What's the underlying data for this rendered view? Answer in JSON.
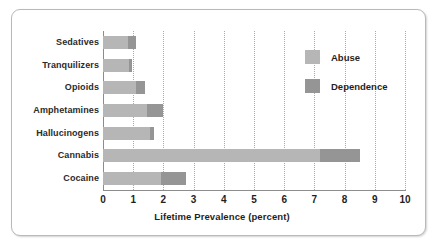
{
  "chart_data": {
    "type": "bar",
    "orientation": "horizontal",
    "stacked": true,
    "title": "",
    "xlabel": "Lifetime Prevalence (percent)",
    "ylabel": "",
    "xlim": [
      0,
      10
    ],
    "xticks": [
      0,
      1,
      2,
      3,
      4,
      5,
      6,
      7,
      8,
      9,
      10
    ],
    "xticklabels": [
      "0",
      "1",
      "2",
      "3",
      "4",
      "5",
      "6",
      "7",
      "8",
      "9",
      "10"
    ],
    "grid": "vertical-dotted",
    "legend_position": "upper-right-inside",
    "categories": [
      "Sedatives",
      "Tranquilizers",
      "Opioids",
      "Amphetamines",
      "Hallucinogens",
      "Cannabis",
      "Cocaine"
    ],
    "series": [
      {
        "name": "Abuse",
        "color": "#b6b6b6",
        "values": [
          0.83,
          0.85,
          1.1,
          1.45,
          1.55,
          7.2,
          1.92
        ]
      },
      {
        "name": "Dependence",
        "color": "#959595",
        "values": [
          0.27,
          0.12,
          0.3,
          0.55,
          0.15,
          1.3,
          0.83
        ]
      }
    ],
    "totals": [
      1.1,
      0.97,
      1.4,
      2.0,
      1.7,
      8.5,
      2.75
    ]
  },
  "legend": {
    "items": [
      {
        "label": "Abuse",
        "swatch": "abuse"
      },
      {
        "label": "Dependence",
        "swatch": "dep"
      }
    ]
  },
  "colors": {
    "abuse": "#b6b6b6",
    "dependence": "#959595",
    "frame_border": "#b9b9b9",
    "axis": "#8c8c8c",
    "gridline": "#a9a9a9",
    "text": "#1f1f1f",
    "background": "#ffffff"
  }
}
